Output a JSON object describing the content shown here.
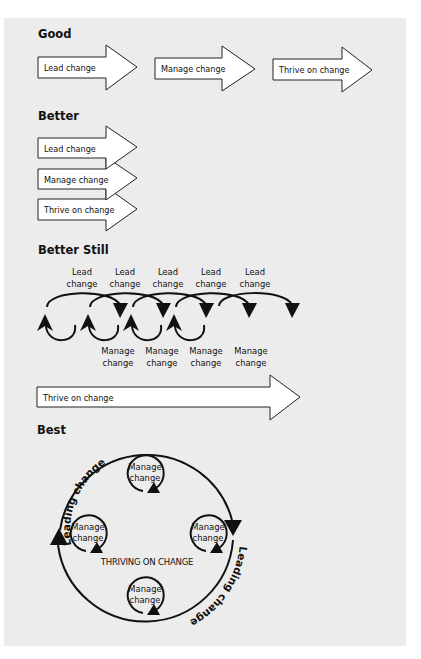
{
  "sections": {
    "good": {
      "title": "Good",
      "arrows": [
        "Lead change",
        "Manage change",
        "Thrive on change"
      ]
    },
    "better": {
      "title": "Better",
      "arrows": [
        "Lead change",
        "Manage change",
        "Thrive on change"
      ]
    },
    "better_still": {
      "title": "Better Still",
      "lead_labels": [
        {
          "line1": "Lead",
          "line2": "change"
        },
        {
          "line1": "Lead",
          "line2": "change"
        },
        {
          "line1": "Lead",
          "line2": "change"
        },
        {
          "line1": "Lead",
          "line2": "change"
        },
        {
          "line1": "Lead",
          "line2": "change"
        }
      ],
      "manage_labels": [
        {
          "line1": "Manage",
          "line2": "change"
        },
        {
          "line1": "Manage",
          "line2": "change"
        },
        {
          "line1": "Manage",
          "line2": "change"
        },
        {
          "line1": "Manage",
          "line2": "change"
        }
      ],
      "thrive_arrow": "Thrive on change"
    },
    "best": {
      "title": "Best",
      "outer_label_top": "Leading change",
      "outer_label_bottom": "Leading change",
      "center_label": "THRIVING ON CHANGE",
      "manage_circles": [
        {
          "line1": "Manage",
          "line2": "change"
        },
        {
          "line1": "Manage",
          "line2": "change"
        },
        {
          "line1": "Manage",
          "line2": "change"
        },
        {
          "line1": "Manage",
          "line2": "change"
        }
      ]
    }
  },
  "colors": {
    "page_background": "#ececec",
    "outer_background": "#ffffff",
    "ink": "#111111",
    "arrow_fill": "#ffffff"
  }
}
